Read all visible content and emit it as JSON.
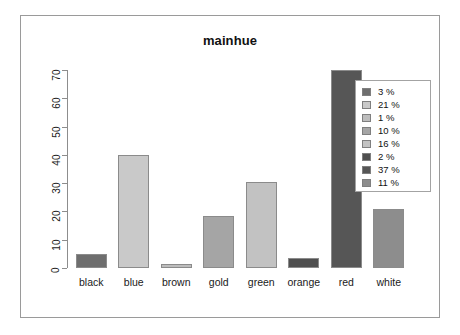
{
  "chart_data": {
    "type": "bar",
    "title": "mainhue",
    "xlabel": "",
    "ylabel": "",
    "categories": [
      "black",
      "blue",
      "brown",
      "gold",
      "green",
      "orange",
      "red",
      "white"
    ],
    "values": [
      5,
      40,
      1.5,
      18.5,
      30.5,
      3.5,
      70,
      21
    ],
    "ylim": [
      0,
      70
    ],
    "yticks": [
      0,
      10,
      20,
      30,
      40,
      50,
      60,
      70
    ],
    "ytick_labels": [
      "0",
      "10",
      "20",
      "30",
      "40",
      "50",
      "60",
      "70"
    ],
    "grid": false,
    "legend_position": "top-right",
    "legend_entries": [
      {
        "label": "3 %",
        "color": "#6e6e6e"
      },
      {
        "label": "21 %",
        "color": "#c9c9c9"
      },
      {
        "label": "1 %",
        "color": "#bdbdbd"
      },
      {
        "label": "10 %",
        "color": "#a5a5a5"
      },
      {
        "label": "16 %",
        "color": "#c2c2c2"
      },
      {
        "label": "2 %",
        "color": "#4f4f4f"
      },
      {
        "label": "37 %",
        "color": "#565656"
      },
      {
        "label": "11 %",
        "color": "#8d8d8d"
      }
    ],
    "bar_colors": [
      "#6e6e6e",
      "#c9c9c9",
      "#bdbdbd",
      "#a5a5a5",
      "#c2c2c2",
      "#4f4f4f",
      "#565656",
      "#8d8d8d"
    ]
  },
  "colors": {
    "frame_border": "#9a9a9a",
    "axis": "#8d8d8d",
    "bar_outline": "#8b8b8b",
    "text": "#111111",
    "background": "#ffffff"
  }
}
